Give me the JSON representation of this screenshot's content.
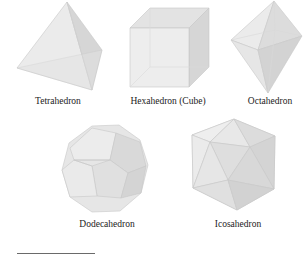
{
  "figure": {
    "solids": [
      {
        "name": "Tetrahedron",
        "label": "Tetrahedron"
      },
      {
        "name": "Hexahedron",
        "label": "Hexahedron (Cube)"
      },
      {
        "name": "Octahedron",
        "label": "Octahedron"
      },
      {
        "name": "Dodecahedron",
        "label": "Dodecahedron"
      },
      {
        "name": "Icosahedron",
        "label": "Icosahedron"
      }
    ],
    "colors": {
      "face_light": "#ececec",
      "face_mid": "#e0e0e0",
      "face_dark": "#d2d2d2",
      "edge": "#c4c4c4",
      "label_text": "#222222",
      "rule": "#6a6a6a"
    }
  }
}
